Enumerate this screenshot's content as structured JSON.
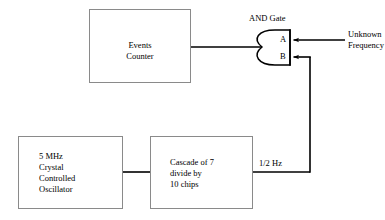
{
  "diagram": {
    "stroke_color": "#000000",
    "box_border_color": "#8a8a8a",
    "background_color": "#ffffff",
    "blocks": [
      {
        "id": "events-counter",
        "label": "Events\nCounter",
        "align": "center",
        "x": 89,
        "y": 9,
        "w": 102,
        "h": 74
      },
      {
        "id": "oscillator",
        "label": "5 MHz\nCrystal\nControlled\nOscillator",
        "align": "left",
        "x": 18,
        "y": 136,
        "w": 105,
        "h": 73
      },
      {
        "id": "cascade-divider",
        "label": "Cascade of 7\ndivide by\n10 chips",
        "align": "left",
        "x": 150,
        "y": 136,
        "w": 103,
        "h": 73
      }
    ],
    "gate": {
      "id": "and-gate",
      "type": "AND",
      "title": "AND Gate",
      "input_a_label": "A",
      "input_b_label": "B"
    },
    "annotations": {
      "unknown_frequency": "Unknown\nFrequency",
      "half_hz": "1/2 Hz"
    }
  }
}
